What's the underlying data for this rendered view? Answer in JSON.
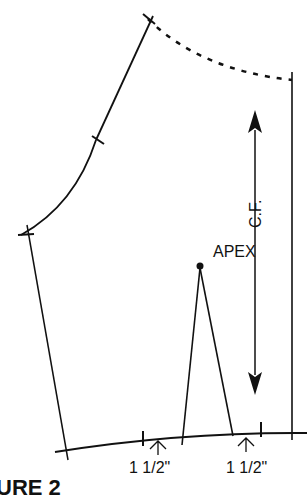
{
  "diagram": {
    "type": "sewing pattern draft (bodice front)",
    "labels": {
      "apex": "APEX",
      "center_front": "C.F.",
      "measure_left": "1 1/2\"",
      "measure_right": "1 1/2\"",
      "figure_caption": "URE 2"
    },
    "colors": {
      "line": "#111111",
      "background": "#ffffff"
    }
  }
}
